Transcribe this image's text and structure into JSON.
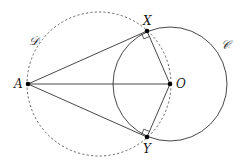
{
  "diagram": {
    "points": {
      "A": {
        "label": "A",
        "x": 28,
        "y": 84
      },
      "X": {
        "label": "X",
        "x": 147,
        "y": 31
      },
      "O": {
        "label": "O",
        "x": 170,
        "y": 84
      },
      "Y": {
        "label": "Y",
        "x": 147,
        "y": 137
      }
    },
    "circles": {
      "C": {
        "label": "𝒞",
        "cx": 170,
        "cy": 84,
        "r": 57,
        "style": "solid"
      },
      "D": {
        "label": "𝒟",
        "cx": 99,
        "cy": 84,
        "r": 72,
        "style": "dashed"
      }
    },
    "segments": [
      "AX",
      "AO",
      "AY",
      "XO",
      "YO"
    ],
    "right_angles": [
      "AXO",
      "AYO"
    ],
    "colors": {
      "stroke": "#333333",
      "dashed": "#555555",
      "point": "#000000"
    }
  }
}
